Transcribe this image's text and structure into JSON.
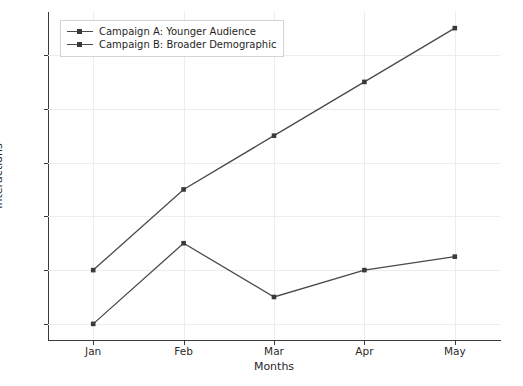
{
  "chart_data": {
    "type": "line",
    "title": "",
    "xlabel": "Months",
    "ylabel": "Interactions",
    "categories": [
      "Jan",
      "Feb",
      "Mar",
      "Apr",
      "May"
    ],
    "series": [
      {
        "name": "Campaign A: Younger Audience",
        "values": [
          120,
          150,
          170,
          190,
          210
        ],
        "color": "#4a4a4a",
        "marker": "square"
      },
      {
        "name": "Campaign B: Broader Demographic",
        "values": [
          100,
          130,
          110,
          120,
          125
        ],
        "color": "#4a4a4a",
        "marker": "square"
      }
    ],
    "ylim": [
      94,
      216
    ],
    "yticks": [
      100,
      120,
      140,
      160,
      180,
      200
    ],
    "ytick_labels": [
      "100",
      "120",
      "140",
      "160",
      "180",
      "200"
    ],
    "xtick_labels": [
      "Jan",
      "Feb",
      "Mar",
      "Apr",
      "May"
    ],
    "grid": true,
    "grid_color": "#ececec",
    "legend_position": "upper left",
    "background": "#ffffff"
  },
  "axes": {
    "y_label": "Interactions",
    "x_label": "Months"
  },
  "legend": {
    "entries": [
      "Campaign A: Younger Audience",
      "Campaign B: Broader Demographic"
    ]
  }
}
